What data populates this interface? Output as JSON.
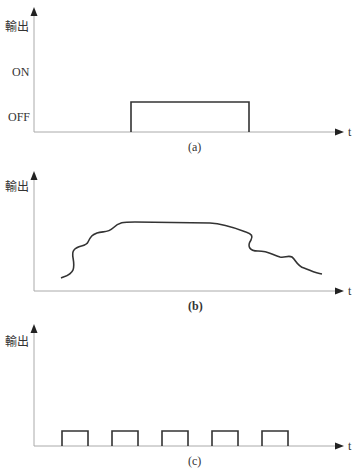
{
  "diagrams": [
    {
      "id": "a",
      "caption": "(a)",
      "ylabel": "輸出",
      "xlabel": "t",
      "yticks": [
        "ON",
        "OFF"
      ],
      "description": "single on/off pulse"
    },
    {
      "id": "b",
      "caption": "(b)",
      "ylabel": "輸出",
      "xlabel": "t",
      "description": "continuous irregular output curve"
    },
    {
      "id": "c",
      "caption": "(c)",
      "ylabel": "輸出",
      "xlabel": "t",
      "description": "five periodic short pulses"
    }
  ],
  "colors": {
    "axis": "#999999",
    "signal": "#333333",
    "text": "#333333"
  }
}
